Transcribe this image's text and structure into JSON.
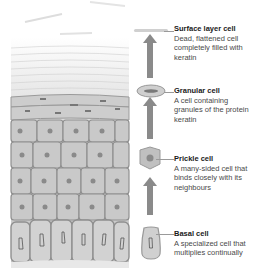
{
  "diagram": {
    "type": "epidermis-cell-layers",
    "flow_direction": "upward",
    "colors": {
      "cell_fill": "#c9c9c9",
      "cell_border": "#8f8f8f",
      "nucleus": "#8a8a8a",
      "arrow": "#8a8a8a",
      "title_text": "#1a1a1a",
      "body_text": "#4a4a4a"
    },
    "layers": [
      {
        "id": "surface",
        "title": "Surface layer cell",
        "description": "Dead, flattened cell completely filled with keratin"
      },
      {
        "id": "granular",
        "title": "Granular cell",
        "description": "A cell containing granules of the protein keratin"
      },
      {
        "id": "prickle",
        "title": "Prickle cell",
        "description": "A many-sided cell that binds closely with its neighbours"
      },
      {
        "id": "basal",
        "title": "Basal cell",
        "description": "A specialized cell that multiplies continually"
      }
    ]
  }
}
